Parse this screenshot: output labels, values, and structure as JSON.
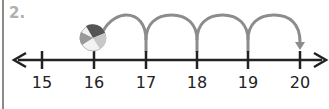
{
  "problem": {
    "number": "2."
  },
  "number_line": {
    "start": 15,
    "end": 20,
    "ticks": [
      {
        "value": 15,
        "label": "15",
        "x": 42
      },
      {
        "value": 16,
        "label": "16",
        "x": 94
      },
      {
        "value": 17,
        "label": "17",
        "x": 146
      },
      {
        "value": 18,
        "label": "18",
        "x": 197
      },
      {
        "value": 19,
        "label": "19",
        "x": 248
      },
      {
        "value": 20,
        "label": "20",
        "x": 300
      }
    ],
    "arrows_both_ends": true
  },
  "jumps": [
    {
      "from": 16,
      "to": 17
    },
    {
      "from": 17,
      "to": 18
    },
    {
      "from": 18,
      "to": 19
    },
    {
      "from": 19,
      "to": 20
    }
  ],
  "ball": {
    "position": 16
  },
  "colors": {
    "line": "#222222",
    "arc": "#8c8c8c",
    "label_num": "#b0b0b0"
  }
}
